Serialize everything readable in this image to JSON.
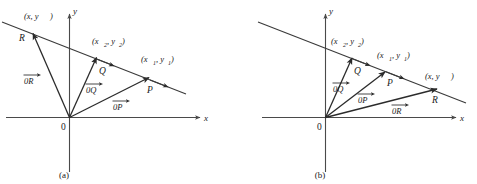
{
  "figure": {
    "background_color": "#ffffff",
    "line_color": "#2b2b2b",
    "axis_color": "#4a4a4a"
  },
  "panels": [
    {
      "id": "a",
      "caption": "(a)",
      "axes": {
        "x_label": "x",
        "y_label": "y",
        "origin_label": "0"
      },
      "points": [
        {
          "name": "R",
          "point_label": "R",
          "coord_label": "(x, y)",
          "coord_base": "(x, y)",
          "coord_sub": ""
        },
        {
          "name": "Q",
          "point_label": "Q",
          "coord_label": "(x2, y2)",
          "coord_base": "(x",
          "coord_sub": "2"
        },
        {
          "name": "P",
          "point_label": "P",
          "coord_label": "(x1, y1)",
          "coord_base": "(x",
          "coord_sub": "1"
        }
      ],
      "vectors": [
        {
          "name": "OR",
          "label": "0R"
        },
        {
          "name": "OQ",
          "label": "0Q"
        },
        {
          "name": "OP",
          "label": "0P"
        }
      ]
    },
    {
      "id": "b",
      "caption": "(b)",
      "axes": {
        "x_label": "x",
        "y_label": "y",
        "origin_label": "0"
      },
      "points": [
        {
          "name": "Q",
          "point_label": "Q",
          "coord_label": "(x2, y2)",
          "coord_base": "(x",
          "coord_sub": "2"
        },
        {
          "name": "P",
          "point_label": "P",
          "coord_label": "(x1, y1)",
          "coord_base": "(x",
          "coord_sub": "1"
        },
        {
          "name": "R",
          "point_label": "R",
          "coord_label": "(x, y)",
          "coord_base": "(x, y)",
          "coord_sub": ""
        }
      ],
      "vectors": [
        {
          "name": "OQ",
          "label": "0Q"
        },
        {
          "name": "OP",
          "label": "0P"
        },
        {
          "name": "OR",
          "label": "0R"
        }
      ]
    }
  ],
  "text": {
    "x_axis": "x",
    "y_axis": "y",
    "origin": "0",
    "caption_a": "(a)",
    "caption_b": "(b)",
    "point_R": "R",
    "point_Q": "Q",
    "point_P": "P",
    "coord_xy_open": "(x, y",
    "coord_xy_close": ")",
    "coord_x_open": "(x",
    "coord_comma_y": ", y",
    "coord_close": ")",
    "sub_1": "1",
    "sub_2": "2",
    "vec_OR": "0R",
    "vec_OQ": "0Q",
    "vec_OP": "0P"
  }
}
